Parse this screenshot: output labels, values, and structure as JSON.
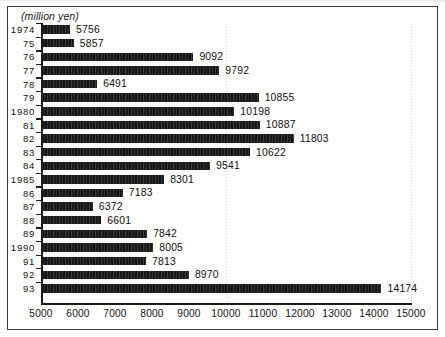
{
  "figure": {
    "unit_label": "(million yen)",
    "frame_color": "#3a3a38",
    "bar_color": "#1d1d1d",
    "background": "#fdfdfc"
  },
  "chart_data": {
    "type": "bar",
    "orientation": "horizontal",
    "title": "",
    "subtitle": "",
    "xlabel": "(million yen)",
    "ylabel": "",
    "xlim": [
      5000,
      15000
    ],
    "xticks": [
      5000,
      6000,
      7000,
      8000,
      9000,
      10000,
      11000,
      12000,
      13000,
      14000,
      15000
    ],
    "xticklabels": [
      "5000",
      "6000",
      "7000",
      "8000",
      "9000",
      "10000",
      "11000",
      "12000",
      "13000",
      "14000",
      "15000"
    ],
    "grid": "vertical-dotted",
    "gridlines": [
      10000,
      15000
    ],
    "legend": "none",
    "categories": [
      "1974",
      "75",
      "76",
      "77",
      "78",
      "79",
      "1980",
      "81",
      "82",
      "83",
      "84",
      "1985",
      "86",
      "87",
      "88",
      "89",
      "1990",
      "91",
      "92",
      "93"
    ],
    "values": [
      5756,
      5857,
      9092,
      9792,
      6491,
      10855,
      10198,
      10887,
      11803,
      10622,
      9541,
      8301,
      7183,
      6372,
      6601,
      7842,
      8005,
      7813,
      8970,
      14174
    ],
    "datalabels": [
      "5756",
      "5857",
      "9092",
      "9792",
      "6491",
      "10855",
      "10198",
      "10887",
      "11803",
      "10622",
      "9541",
      "8301",
      "7183",
      "6372",
      "6601",
      "7842",
      "8005",
      "7813",
      "8970",
      "14174"
    ]
  }
}
